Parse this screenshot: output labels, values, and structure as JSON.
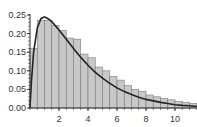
{
  "chart_data": {
    "type": "bar",
    "title": "",
    "xlabel": "",
    "ylabel": "",
    "xlim": [
      0,
      11.8
    ],
    "ylim": [
      0,
      0.26
    ],
    "grid": false,
    "legend": null,
    "bin_width": 0.5,
    "bin_starts": [
      0,
      0.5,
      1,
      1.5,
      2,
      2.5,
      3,
      3.5,
      4,
      4.5,
      5,
      5.5,
      6,
      6.5,
      7,
      7.5,
      8,
      8.5,
      9,
      9.5,
      10,
      10.5,
      11
    ],
    "values": [
      0.16,
      0.235,
      0.235,
      0.222,
      0.208,
      0.188,
      0.185,
      0.145,
      0.135,
      0.11,
      0.1,
      0.085,
      0.075,
      0.06,
      0.05,
      0.045,
      0.035,
      0.03,
      0.025,
      0.022,
      0.018,
      0.015,
      0.012
    ],
    "series": [
      {
        "name": "histogram",
        "type": "bar",
        "color": "#c8c8c8"
      },
      {
        "name": "density curve",
        "type": "line",
        "color": "#222222",
        "x": [
          0,
          0.1,
          0.25,
          0.5,
          0.75,
          1,
          1.25,
          1.5,
          2,
          2.5,
          3,
          3.5,
          4,
          4.5,
          5,
          5.5,
          6,
          6.5,
          7,
          7.5,
          8,
          8.5,
          9,
          9.5,
          10,
          10.5,
          11,
          11.5
        ],
        "y": [
          0,
          0.07,
          0.15,
          0.215,
          0.24,
          0.245,
          0.24,
          0.232,
          0.21,
          0.185,
          0.16,
          0.136,
          0.115,
          0.096,
          0.08,
          0.066,
          0.054,
          0.044,
          0.036,
          0.029,
          0.023,
          0.019,
          0.015,
          0.012,
          0.009,
          0.007,
          0.006,
          0.004
        ]
      }
    ],
    "x_ticks": [
      2,
      4,
      6,
      8,
      10
    ],
    "x_tick_labels": [
      "2",
      "4",
      "6",
      "8",
      "10"
    ],
    "y_ticks": [
      0,
      0.05,
      0.1,
      0.15,
      0.2,
      0.25
    ],
    "y_tick_labels": [
      "0.00",
      "0.05",
      "0.10",
      "0.15",
      "0.20",
      "0.25"
    ]
  }
}
